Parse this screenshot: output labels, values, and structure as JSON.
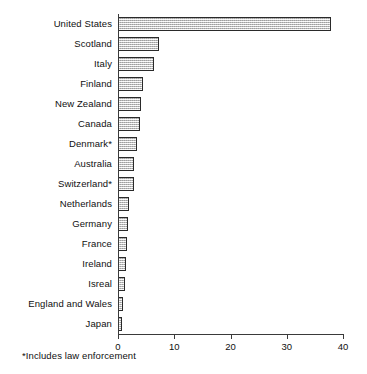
{
  "chart_data": {
    "type": "bar",
    "orientation": "horizontal",
    "title": "",
    "subtitle": "",
    "xlabel": "",
    "ylabel": "",
    "xlim": [
      0,
      40
    ],
    "xticks": [
      0,
      10,
      20,
      30,
      40
    ],
    "xtick_labels": [
      "0",
      "10",
      "20",
      "30",
      "40"
    ],
    "grid": false,
    "legend": null,
    "categories": [
      "United States",
      "Scotland",
      "Italy",
      "Finland",
      "New Zealand",
      "Canada",
      "Denmark*",
      "Australia",
      "Switzerland*",
      "Netherlands",
      "Germany",
      "France",
      "Ireland",
      "Isreal",
      "England and Wales",
      "Japan"
    ],
    "values": [
      37.8,
      7.3,
      6.4,
      4.4,
      4.1,
      3.9,
      3.3,
      2.9,
      2.8,
      1.9,
      1.8,
      1.6,
      1.4,
      1.3,
      0.9,
      0.7
    ],
    "annotations": [
      "*Includes law enforcement"
    ],
    "bar_fill_color": "#d7d7d7",
    "bar_border_color": "#2a2a2a",
    "axis_color": "#3a3a3a"
  },
  "footnote": "*Includes law enforcement"
}
